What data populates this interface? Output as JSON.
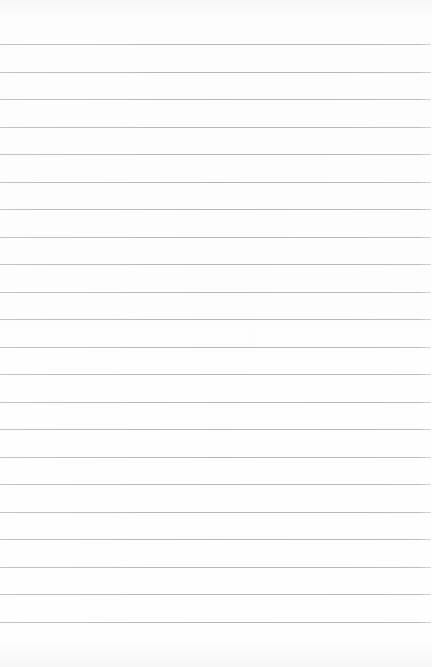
{
  "paper": {
    "line_count": 22,
    "first_line_y": 44,
    "line_spacing": 27.5,
    "line_color": "#b8b8b8",
    "background_color": "#fdfdfd"
  }
}
